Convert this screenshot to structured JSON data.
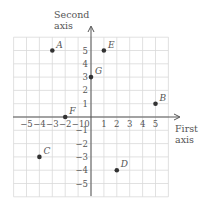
{
  "axes": {
    "x_title_line1": "First",
    "x_title_line2": "axis",
    "y_title_line1": "Second",
    "y_title_line2": "axis",
    "x_ticks": [
      {
        "value": -5,
        "label": "−5"
      },
      {
        "value": -4,
        "label": "−4"
      },
      {
        "value": -3,
        "label": "−3"
      },
      {
        "value": -2,
        "label": "−2"
      },
      {
        "value": -1,
        "label": "−1"
      },
      {
        "value": 0,
        "label": "0"
      },
      {
        "value": 1,
        "label": "1"
      },
      {
        "value": 2,
        "label": "2"
      },
      {
        "value": 3,
        "label": "3"
      },
      {
        "value": 4,
        "label": "4"
      },
      {
        "value": 5,
        "label": "5"
      }
    ],
    "y_ticks": [
      {
        "value": 5,
        "label": "5"
      },
      {
        "value": 4,
        "label": "4"
      },
      {
        "value": 3,
        "label": "3"
      },
      {
        "value": 2,
        "label": "2"
      },
      {
        "value": 1,
        "label": "1"
      },
      {
        "value": -1,
        "label": "−1"
      },
      {
        "value": -2,
        "label": "−2"
      },
      {
        "value": -3,
        "label": "−3"
      },
      {
        "value": -4,
        "label": "−4"
      },
      {
        "value": -5,
        "label": "−5"
      }
    ]
  },
  "points": [
    {
      "label": "A",
      "x": -3,
      "y": 5
    },
    {
      "label": "B",
      "x": 5,
      "y": 1
    },
    {
      "label": "C",
      "x": -4,
      "y": -3
    },
    {
      "label": "D",
      "x": 2,
      "y": -4
    },
    {
      "label": "E",
      "x": 1,
      "y": 5
    },
    {
      "label": "F",
      "x": -2,
      "y": 0
    },
    {
      "label": "G",
      "x": 0,
      "y": 3
    }
  ],
  "colors": {
    "grid": "#d9d9d9",
    "axis": "#555555",
    "point": "#333333"
  }
}
